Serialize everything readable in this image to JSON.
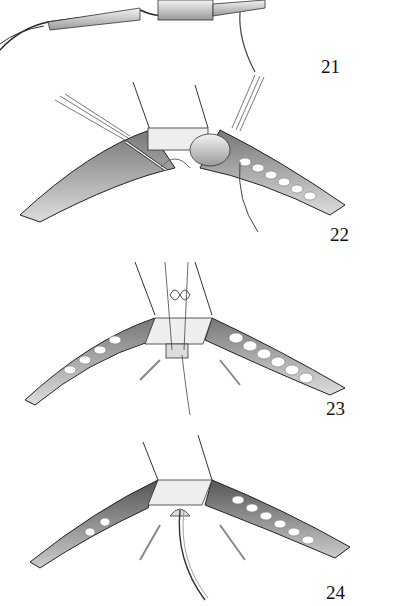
{
  "figure": {
    "type": "surgical-illustration",
    "style": "grayscale pencil rendering",
    "panels": [
      {
        "number": "21",
        "description": "catheter/device with leads and retracted sutures above incision"
      },
      {
        "number": "22",
        "description": "incision with retractors, sutured cuff and catheter tube"
      },
      {
        "number": "23",
        "description": "incision with square patch, figure-eight suture tied"
      },
      {
        "number": "24",
        "description": "incision with patch and catheter exiting beneath"
      }
    ]
  },
  "colors": {
    "background": "#ffffff",
    "ink": "#111111",
    "shadow": "#555555",
    "tissue": "#bbbbbb"
  }
}
